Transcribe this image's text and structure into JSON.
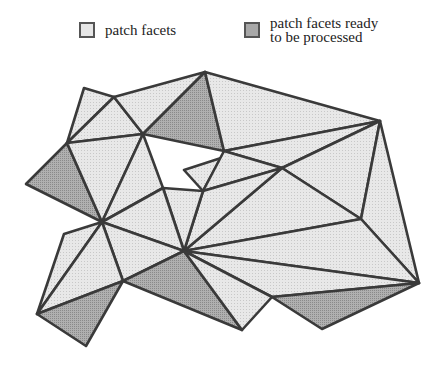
{
  "legend": {
    "items": [
      {
        "label": "patch facets",
        "fill": "#e6e6e6"
      },
      {
        "label_line1": "patch facets ready",
        "label_line2": "to be processed",
        "fill": "#a8a8a8"
      }
    ]
  },
  "diagram": {
    "stroke": "#3a3a3a",
    "light_fill": "#e8e8e8",
    "dark_fill": "#b0b0b0",
    "vertices": {
      "A": [
        84,
        88
      ],
      "B": [
        114,
        97
      ],
      "C": [
        205,
        72
      ],
      "D": [
        380,
        121
      ],
      "E": [
        67,
        143
      ],
      "F": [
        143,
        134
      ],
      "G": [
        224,
        151
      ],
      "G2": [
        221,
        158
      ],
      "H": [
        26,
        184
      ],
      "I": [
        102,
        222
      ],
      "J": [
        163,
        188
      ],
      "K": [
        184,
        170
      ],
      "L": [
        203,
        191
      ],
      "M": [
        282,
        168
      ],
      "N": [
        361,
        219
      ],
      "O": [
        184,
        251
      ],
      "P": [
        419,
        283
      ],
      "Q": [
        64,
        234
      ],
      "R": [
        123,
        281
      ],
      "S": [
        37,
        314
      ],
      "T": [
        86,
        346
      ],
      "U": [
        242,
        330
      ],
      "V": [
        272,
        297
      ],
      "W": [
        322,
        329
      ]
    },
    "facets": [
      {
        "v": [
          "A",
          "B",
          "E"
        ],
        "state": "patch"
      },
      {
        "v": [
          "B",
          "F",
          "E"
        ],
        "state": "patch"
      },
      {
        "v": [
          "B",
          "C",
          "F"
        ],
        "state": "patch"
      },
      {
        "v": [
          "C",
          "G",
          "F"
        ],
        "state": "ready"
      },
      {
        "v": [
          "C",
          "D",
          "G"
        ],
        "state": "patch"
      },
      {
        "v": [
          "E",
          "H",
          "I"
        ],
        "state": "ready"
      },
      {
        "v": [
          "E",
          "F",
          "I"
        ],
        "state": "patch"
      },
      {
        "v": [
          "F",
          "J",
          "I"
        ],
        "state": "patch"
      },
      {
        "v": [
          "G",
          "D",
          "M"
        ],
        "state": "patch"
      },
      {
        "v": [
          "G2",
          "K",
          "L"
        ],
        "state": "patch"
      },
      {
        "v": [
          "G",
          "M",
          "L"
        ],
        "state": "patch"
      },
      {
        "v": [
          "M",
          "D",
          "N"
        ],
        "state": "patch"
      },
      {
        "v": [
          "M",
          "N",
          "O"
        ],
        "state": "patch"
      },
      {
        "v": [
          "L",
          "M",
          "O"
        ],
        "state": "patch"
      },
      {
        "v": [
          "J",
          "L",
          "O"
        ],
        "state": "patch"
      },
      {
        "v": [
          "I",
          "J",
          "O"
        ],
        "state": "patch"
      },
      {
        "v": [
          "D",
          "P",
          "N"
        ],
        "state": "patch"
      },
      {
        "v": [
          "N",
          "P",
          "O"
        ],
        "state": "patch"
      },
      {
        "v": [
          "I",
          "O",
          "R"
        ],
        "state": "patch"
      },
      {
        "v": [
          "O",
          "U",
          "R"
        ],
        "state": "ready"
      },
      {
        "v": [
          "O",
          "P",
          "V"
        ],
        "state": "patch"
      },
      {
        "v": [
          "O",
          "V",
          "U"
        ],
        "state": "patch"
      },
      {
        "v": [
          "V",
          "P",
          "W"
        ],
        "state": "ready"
      },
      {
        "v": [
          "Q",
          "I",
          "S"
        ],
        "state": "patch"
      },
      {
        "v": [
          "I",
          "R",
          "S"
        ],
        "state": "patch"
      },
      {
        "v": [
          "S",
          "R",
          "T"
        ],
        "state": "ready"
      }
    ]
  }
}
